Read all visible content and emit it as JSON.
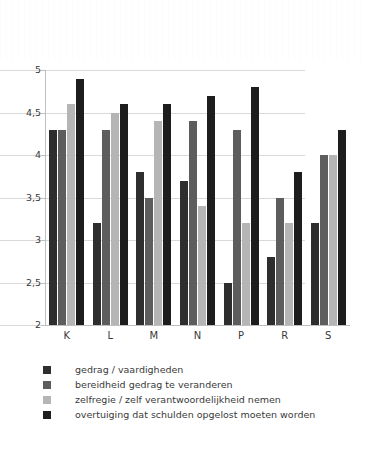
{
  "chart_data": {
    "type": "bar",
    "title": "",
    "subtitle": "",
    "xlabel": "",
    "ylabel": "",
    "ylim": [
      2,
      5
    ],
    "ytick_values": [
      5,
      4.5,
      4,
      3.5,
      3,
      2.5,
      2
    ],
    "ytick_labels": [
      "5",
      "4,5",
      "4",
      "3,5",
      "3",
      "2,5",
      "2"
    ],
    "grid": true,
    "legend_position": "below",
    "categories": [
      "K",
      "L",
      "M",
      "N",
      "P",
      "R",
      "S"
    ],
    "series": [
      {
        "name": "gedrag / vaardigheden",
        "color": "#2e2e2e",
        "values": [
          4.3,
          3.2,
          3.8,
          3.7,
          2.5,
          2.8,
          3.2
        ]
      },
      {
        "name": "bereidheid gedrag te veranderen",
        "color": "#5d5d5d",
        "values": [
          4.3,
          4.3,
          3.5,
          4.4,
          4.3,
          3.5,
          4.0
        ]
      },
      {
        "name": "zelfregie / zelf verantwoordelijkheid nemen",
        "color": "#b5b5b5",
        "values": [
          4.6,
          4.5,
          4.4,
          3.4,
          3.2,
          3.2,
          4.0
        ]
      },
      {
        "name": "overtuiging dat schulden opgelost moeten worden",
        "color": "#1d1d1d",
        "values": [
          4.9,
          4.6,
          4.6,
          4.7,
          4.8,
          3.8,
          4.3
        ]
      }
    ]
  }
}
